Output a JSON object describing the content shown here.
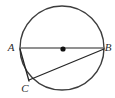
{
  "figure": {
    "type": "circle-geometry-diagram",
    "background_color": "#ffffff",
    "canvas": {
      "width": 115,
      "height": 98
    },
    "circle": {
      "name": "circle",
      "center": {
        "x": 62,
        "y": 48
      },
      "radius": 42,
      "stroke_color": "#3d3d3d",
      "stroke_width": 1.4,
      "fill": "none"
    },
    "center_point": {
      "label": "",
      "x": 63,
      "y": 49,
      "radius": 2.6,
      "color": "#111111"
    },
    "points": [
      {
        "id": "A",
        "label": "A",
        "x": 20,
        "y": 48,
        "label_x": 11,
        "label_y": 48
      },
      {
        "id": "B",
        "label": "B",
        "x": 104,
        "y": 48,
        "label_x": 108,
        "label_y": 48
      },
      {
        "id": "C",
        "label": "C",
        "x": 29,
        "y": 80,
        "label_x": 25,
        "label_y": 89
      }
    ],
    "segments": [
      {
        "id": "AB",
        "name": "diameter-a-b",
        "from": "A",
        "to": "B",
        "x1": 20,
        "y1": 48,
        "x2": 104,
        "y2": 48,
        "stroke_color": "#6e6e6e",
        "stroke_width": 1.6
      },
      {
        "id": "CB",
        "name": "chord-c-b",
        "from": "C",
        "to": "B",
        "x1": 29,
        "y1": 80,
        "x2": 104,
        "y2": 49,
        "stroke_color": "#262626",
        "stroke_width": 1.3
      },
      {
        "id": "AC",
        "name": "chord-a-c",
        "from": "A",
        "to": "C",
        "x1": 20,
        "y1": 49,
        "x2": 29,
        "y2": 81,
        "stroke_color": "#262626",
        "stroke_width": 1.3
      }
    ]
  }
}
